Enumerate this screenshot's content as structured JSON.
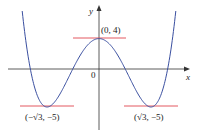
{
  "chart_data": {
    "type": "line",
    "title": "",
    "function": "f(x) = x^4 - 6x^2 + 4",
    "xlabel": "x",
    "ylabel": "y",
    "origin_label": "0",
    "xlim": [
      -3.3,
      3.0
    ],
    "ylim": [
      -8.5,
      8.2
    ],
    "grid": false,
    "series": [
      {
        "name": "f(x)",
        "color": "#3a4fa0",
        "x": [
          -2.7,
          -2.5,
          -2.288,
          -2.0,
          -1.732,
          -1.5,
          -1.2,
          -0.874,
          -0.5,
          0,
          0.5,
          0.874,
          1.2,
          1.5,
          1.732,
          2.0,
          2.288,
          2.5,
          2.7
        ],
        "y": [
          13.4,
          1.56,
          0,
          -4.0,
          -5.0,
          -4.44,
          -2.57,
          0,
          2.56,
          4,
          2.56,
          0,
          -2.57,
          -4.44,
          -5.0,
          -4.0,
          0,
          1.56,
          13.4
        ]
      }
    ],
    "horizontal_tangents": [
      {
        "at_x": 0,
        "y": 4,
        "color": "#e0464e"
      },
      {
        "at_x": -1.732,
        "y": -5,
        "color": "#e0464e"
      },
      {
        "at_x": 1.732,
        "y": -5,
        "color": "#e0464e"
      }
    ],
    "annotations": [
      {
        "text": "(0, 4)",
        "x": 0,
        "y": 4
      },
      {
        "text": "(−√3, −5)",
        "x": -1.732,
        "y": -5
      },
      {
        "text": "(√3, −5)",
        "x": 1.732,
        "y": -5
      }
    ]
  },
  "labels": {
    "x_axis": "x",
    "y_axis": "y",
    "origin": "0",
    "peak": "(0, 4)",
    "min_left": "(−√3, −5)",
    "min_right": "(√3, −5)"
  }
}
